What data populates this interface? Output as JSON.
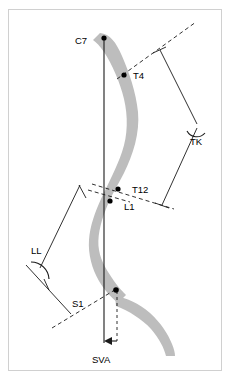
{
  "figure": {
    "background_color": "#ffffff",
    "frame_color": "#d0d0d0",
    "spine_color": "#bdbdbd",
    "line_color": "#1a1a1a",
    "marker_color": "#000000"
  },
  "labels": {
    "c7": "C7",
    "t4": "T4",
    "t12": "T12",
    "l1": "L1",
    "s1": "S1",
    "tk": "TK",
    "ll": "LL",
    "sva": "SVA"
  },
  "landmarks": [
    {
      "name": "C7",
      "label": "C7",
      "x": 104,
      "y": 38
    },
    {
      "name": "T4",
      "label": "T4",
      "x": 124,
      "y": 75
    },
    {
      "name": "T12",
      "label": "T12",
      "x": 118,
      "y": 189
    },
    {
      "name": "L1",
      "label": "L1",
      "x": 110,
      "y": 201
    },
    {
      "name": "S1",
      "label": "S1",
      "x": 114,
      "y": 288
    }
  ],
  "measurements": [
    {
      "name": "TK",
      "label": "TK",
      "description": "Thoracic kyphosis angle between T4 upper endplate and T12 lower endplate",
      "vertex_x": 196,
      "vertex_y": 126
    },
    {
      "name": "LL",
      "label": "LL",
      "description": "Lumbar lordosis angle between L1 upper endplate and S1 upper endplate",
      "vertex_x": 32,
      "vertex_y": 269
    },
    {
      "name": "SVA",
      "label": "SVA",
      "description": "Sagittal vertical axis: horizontal offset from C7 plumb line to S1 posterior corner"
    }
  ],
  "plumb_line": {
    "name": "C7 plumb line",
    "x1": 104,
    "y1": 38,
    "x2": 104,
    "y2": 343
  },
  "label_positions": {
    "c7": {
      "x": 75,
      "y": 44
    },
    "t4": {
      "x": 133,
      "y": 79
    },
    "t12": {
      "x": 132,
      "y": 193
    },
    "l1": {
      "x": 124,
      "y": 209
    },
    "s1": {
      "x": 72,
      "y": 305
    },
    "tk": {
      "x": 196,
      "y": 142
    },
    "ll": {
      "x": 34,
      "y": 252
    },
    "sva": {
      "x": 103,
      "y": 361
    }
  }
}
